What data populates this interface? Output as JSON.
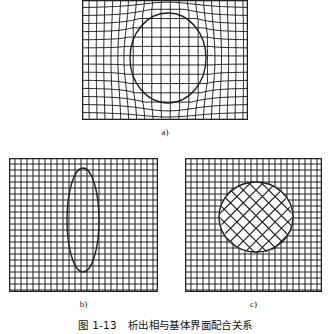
{
  "figure": {
    "caption_number": "图 1-13",
    "caption_text": "析出相与基体界面配合关系",
    "background_color": "#ffffff",
    "line_color": "#222222"
  },
  "panels": [
    {
      "id": "a",
      "label": "a)",
      "interface_type": "coherent",
      "frame": {
        "x": 82,
        "y": 0,
        "width": 166,
        "height": 120
      },
      "grid": {
        "columns": 20,
        "rows": 15,
        "spacing_px": 8,
        "distorted": true,
        "rotation_deg": 0
      },
      "inclusion": {
        "shape": "ellipse",
        "center_x": 168,
        "center_y": 58,
        "radius_x": 38,
        "radius_y": 45,
        "interior_grid": "continuous-with-matrix"
      }
    },
    {
      "id": "b",
      "label": "b)",
      "interface_type": "semi-coherent",
      "frame": {
        "x": 9,
        "y": 158,
        "width": 149,
        "height": 134
      },
      "grid": {
        "columns": 25,
        "rows": 22,
        "spacing_px": 6,
        "distorted": false,
        "rotation_deg": 0
      },
      "inclusion": {
        "shape": "ellipse",
        "center_x": 83,
        "center_y": 220,
        "radius_x": 16,
        "radius_y": 52,
        "interior_grid": "continuous-with-matrix"
      }
    },
    {
      "id": "c",
      "label": "c)",
      "interface_type": "incoherent",
      "frame": {
        "x": 185,
        "y": 158,
        "width": 137,
        "height": 134
      },
      "grid": {
        "columns": 23,
        "rows": 22,
        "spacing_px": 6,
        "distorted": false,
        "rotation_deg": 0
      },
      "inclusion": {
        "shape": "circle",
        "center_x": 256,
        "center_y": 217,
        "radius_x": 37,
        "radius_y": 35,
        "interior_grid": "rotated-lattice",
        "interior_rotation_deg": 45,
        "interior_spacing_px": 9
      }
    }
  ],
  "labels": {
    "panel_a": "a)",
    "panel_b": "b)",
    "panel_c": "c)"
  }
}
